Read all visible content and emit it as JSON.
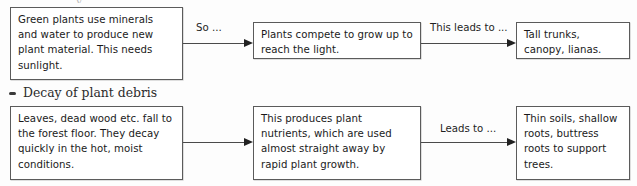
{
  "page": {
    "width": 637,
    "height": 186,
    "background_color": "#fdfdfd",
    "box_border_color": "#5b5b5b",
    "text_color": "#1a1a1a",
    "arrow_color": "#4a4a4a"
  },
  "scan_artifact": {
    "text": "y"
  },
  "heading": {
    "bullet": "bullet-dash-icon",
    "text": "Decay of plant debris"
  },
  "flow": {
    "rows": [
      {
        "id": "row-growth",
        "boxes": [
          {
            "id": "box-green-plants",
            "text": "Green plants use minerals and water to produce new plant material. This needs sunlight."
          },
          {
            "id": "box-plants-compete",
            "text": "Plants compete to grow up to reach the light."
          },
          {
            "id": "box-tall-trunks",
            "text": "Tall trunks, canopy, lianas."
          }
        ],
        "connectors": [
          {
            "id": "connector-so",
            "label": "So ..."
          },
          {
            "id": "connector-this-leads-to",
            "label": "This leads to ..."
          }
        ]
      },
      {
        "id": "row-decay",
        "boxes": [
          {
            "id": "box-leaves-fall",
            "text": "Leaves, dead wood etc. fall to the forest floor. They decay quickly in the hot, moist conditions."
          },
          {
            "id": "box-plant-nutrients",
            "text": "This produces plant nutrients, which are used almost straight away by rapid plant growth."
          },
          {
            "id": "box-thin-soils",
            "text": "Thin soils, shallow roots, buttress roots to support trees."
          }
        ],
        "connectors": [
          {
            "id": "connector-unlabelled",
            "label": ""
          },
          {
            "id": "connector-leads-to",
            "label": "Leads to ..."
          }
        ]
      }
    ]
  }
}
